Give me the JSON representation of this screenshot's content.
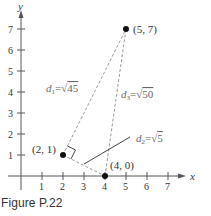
{
  "figure": {
    "caption": "Figure P.22",
    "axes": {
      "x_label": "x",
      "y_label": "y",
      "x_ticks": [
        "1",
        "2",
        "3",
        "4",
        "5",
        "6",
        "7"
      ],
      "y_ticks": [
        "1",
        "2",
        "3",
        "4",
        "5",
        "6",
        "7"
      ]
    },
    "points": [
      {
        "label": "(2, 1)",
        "x": 2,
        "y": 1
      },
      {
        "label": "(4, 0)",
        "x": 4,
        "y": 0
      },
      {
        "label": "(5, 7)",
        "x": 5,
        "y": 7
      }
    ],
    "distances": [
      {
        "name": "d",
        "sub": "1",
        "eq": "=",
        "radical": "√",
        "value": "45",
        "from": "(2, 1)",
        "to": "(5, 7)"
      },
      {
        "name": "d",
        "sub": "2",
        "eq": "=",
        "radical": "√",
        "value": "5",
        "from": "(2, 1)",
        "to": "(4, 0)"
      },
      {
        "name": "d",
        "sub": "3",
        "eq": "=",
        "radical": "√",
        "value": "50",
        "from": "(4, 0)",
        "to": "(5, 7)"
      }
    ],
    "colors": {
      "axis": "#555555",
      "dashed": "#9a9a9a",
      "point": "#111111",
      "pointer": "#444444",
      "text": "#333333"
    }
  }
}
